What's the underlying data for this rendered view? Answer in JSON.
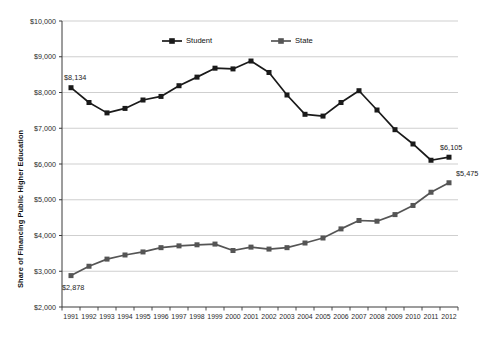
{
  "chart_data": {
    "type": "line",
    "title": "",
    "xlabel": "",
    "ylabel": "Share of Financing Public Higher Education",
    "x": [
      1991,
      1992,
      1993,
      1994,
      1995,
      1996,
      1997,
      1998,
      1999,
      2000,
      2001,
      2002,
      2003,
      2004,
      2005,
      2006,
      2007,
      2008,
      2009,
      2010,
      2011,
      2012
    ],
    "categories": [
      "1991",
      "1992",
      "1993",
      "1994",
      "1995",
      "1996",
      "1997",
      "1998",
      "1999",
      "2000",
      "2001",
      "2002",
      "2003",
      "2004",
      "2005",
      "2006",
      "2007",
      "2008",
      "2009",
      "2010",
      "2011",
      "2012"
    ],
    "ylim": [
      2000,
      10000
    ],
    "ytick_values": [
      2000,
      3000,
      4000,
      5000,
      6000,
      7000,
      8000,
      9000,
      10000
    ],
    "ytick_labels": [
      "$2,000",
      "$3,000",
      "$4,000",
      "$5,000",
      "$6,000",
      "$7,000",
      "$8,000",
      "$9,000",
      "$10,000"
    ],
    "grid": true,
    "legend_position": "top-center-inside",
    "series": [
      {
        "name": "Student",
        "color": "#1a1a1a",
        "values": [
          8134,
          7720,
          7430,
          7555,
          7790,
          7890,
          8190,
          8430,
          8680,
          8660,
          8880,
          8560,
          7930,
          7390,
          7340,
          7720,
          8050,
          7510,
          6960,
          6560,
          6105,
          6190
        ]
      },
      {
        "name": "State",
        "color": "#555555",
        "values": [
          2878,
          3140,
          3340,
          3455,
          3540,
          3660,
          3710,
          3740,
          3760,
          3580,
          3675,
          3620,
          3660,
          3790,
          3930,
          4185,
          4420,
          4400,
          4585,
          4840,
          5210,
          5475
        ]
      }
    ],
    "annotations": [
      {
        "name": "student-start-label",
        "text": "$8,134",
        "series": "Student",
        "x": "1991"
      },
      {
        "name": "student-end-label",
        "text": "$6,105",
        "series": "Student",
        "x": "2011"
      },
      {
        "name": "state-start-label",
        "text": "$2,878",
        "series": "State",
        "x": "1991"
      },
      {
        "name": "state-end-label",
        "text": "$5,475",
        "series": "State",
        "x": "2012"
      }
    ]
  },
  "legend": {
    "items": [
      {
        "label": "Student",
        "color": "#1a1a1a"
      },
      {
        "label": "State",
        "color": "#555555"
      }
    ]
  },
  "colors": {
    "student": "#1a1a1a",
    "state": "#555555",
    "gridline": "#c9c9c9",
    "axis": "#3a3a3a",
    "background": "#ffffff"
  }
}
